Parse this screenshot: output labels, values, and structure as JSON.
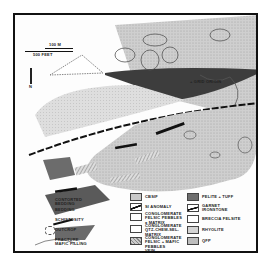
{
  "scale_bar": {
    "metric": "100 m",
    "imperial": "500 feet"
  },
  "north_arrow": "N",
  "grid_origin_label": "+ GRID ORIGIN",
  "legend": {
    "symbols": [
      {
        "label": "CONTORTED BEDDING",
        "icon": "contorted-bedding-symbol"
      },
      {
        "label": "BEDDING",
        "icon": "bedding-symbol"
      },
      {
        "label": "SCHISTOSITY",
        "icon": "schistosity-symbol"
      },
      {
        "label": "OUTCROP",
        "icon": "outcrop-symbol"
      },
      {
        "label": "FRACTURE, MAFIC FILLING",
        "icon": "fracture-symbol"
      }
    ],
    "units_middle": [
      {
        "label": "CBSIF",
        "fill": "#c9c9c9"
      },
      {
        "label": "SI ANOMALY",
        "fill": "#222222"
      },
      {
        "label": "CONGLOMERATE FELSIC PEBBLES ± MATRIX",
        "fill": "#ffffff"
      },
      {
        "label": "CONGLOMERATE QTZ-CHEM-SEL-MATRIX",
        "fill": "#ffffff"
      },
      {
        "label": "CONGLOMERATE FELSIC + MAFIC PEBBLES",
        "fill": "#9a9a9a"
      },
      {
        "label": "VEIN",
        "fill": "none"
      }
    ],
    "units_right": [
      {
        "label": "PELITE + TUFF",
        "fill": "#6e6e6e"
      },
      {
        "label": "GARNET IRONSTONE",
        "fill": "#222222"
      },
      {
        "label": "BRECCIA FELSITE",
        "fill": "#ffffff"
      },
      {
        "label": "RHYOLITE",
        "fill": "#d4d4d4"
      },
      {
        "label": "QFP",
        "fill": "#bdbdbd"
      }
    ]
  },
  "colors": {
    "light_gray": "#c8c8c8",
    "dark_gray": "#3a3a3a",
    "mid_gray": "#8a8a8a",
    "line": "#111111"
  }
}
